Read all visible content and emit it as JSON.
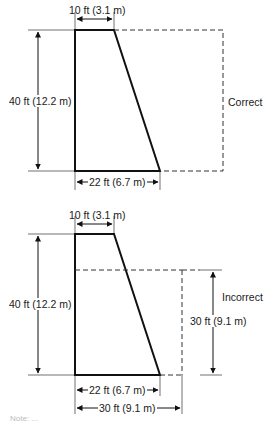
{
  "figure_type": "dam cross-section dimension comparison",
  "top_diagram": {
    "verdict_label": "Correct",
    "top_width_label": "10 ft (3.1 m)",
    "height_label": "40 ft (12.2 m)",
    "base_width_label": "22 ft (6.7 m)"
  },
  "bottom_diagram": {
    "verdict_label": "Incorrect",
    "top_width_label": "10 ft (3.1 m)",
    "height_label": "40 ft (12.2 m)",
    "base_width_label": "22 ft (6.7 m)",
    "dashed_height_label": "30 ft (9.1 m)",
    "dashed_width_label": "30 ft (9.1 m)"
  },
  "note_partial": "Note: ..."
}
